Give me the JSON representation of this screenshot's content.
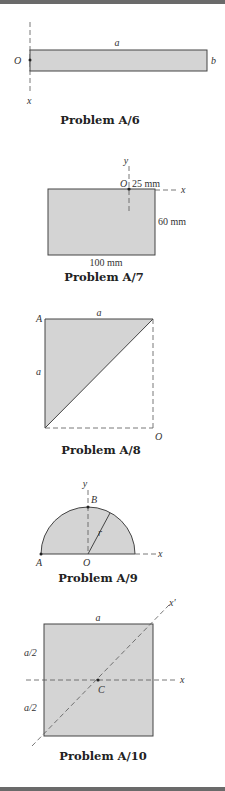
{
  "page": {
    "colors": {
      "fill": "#d4d4d4",
      "stroke": "#444444",
      "border_bar": "#6a6a6a"
    }
  },
  "figures": [
    {
      "id": "A6",
      "caption": "Problem A/6",
      "labels": {
        "top": "a",
        "right": "b",
        "origin": "O",
        "axis": "x"
      }
    },
    {
      "id": "A7",
      "caption": "Problem A/7",
      "labels": {
        "origin": "O",
        "axis_y": "y",
        "axis_x": "x",
        "offset": "25 mm",
        "height": "60 mm",
        "width": "100 mm"
      }
    },
    {
      "id": "A8",
      "caption": "Problem A/8",
      "labels": {
        "corner": "A",
        "top": "a",
        "left": "a",
        "origin": "O"
      }
    },
    {
      "id": "A9",
      "caption": "Problem A/9",
      "labels": {
        "axis_y": "y",
        "top_point": "B",
        "radius": "r",
        "axis_x": "x",
        "left_point": "A",
        "origin": "O"
      }
    },
    {
      "id": "A10",
      "caption": "Problem A/10",
      "labels": {
        "top": "a",
        "upper_half": "a/2",
        "lower_half": "a/2",
        "centroid": "C",
        "axis_x": "x",
        "axis_x_prime": "x′"
      }
    }
  ]
}
